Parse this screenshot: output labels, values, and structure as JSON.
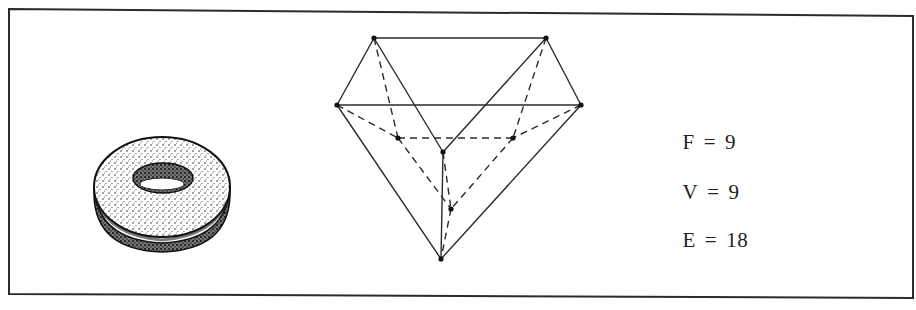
{
  "figure": {
    "border_color": "#2b2b2b",
    "stroke_color": "#2b2b2b",
    "background": "#ffffff"
  },
  "left_object": {
    "name": "doughnut (torus)",
    "center": [
      162,
      189
    ],
    "rx": 68,
    "ry": 48
  },
  "polyhedron": {
    "vertices": {
      "A": [
        374,
        38
      ],
      "B": [
        546,
        38
      ],
      "C": [
        337,
        105
      ],
      "D": [
        581,
        105
      ],
      "E": [
        398,
        138
      ],
      "G": [
        513,
        138
      ],
      "H": [
        443,
        152
      ],
      "I": [
        451,
        209
      ],
      "J": [
        441,
        259
      ]
    },
    "solid_edges": [
      [
        "A",
        "B"
      ],
      [
        "A",
        "C"
      ],
      [
        "B",
        "D"
      ],
      [
        "C",
        "D"
      ],
      [
        "A",
        "H"
      ],
      [
        "B",
        "H"
      ],
      [
        "C",
        "J"
      ],
      [
        "D",
        "J"
      ],
      [
        "H",
        "J"
      ]
    ],
    "dashed_edges": [
      [
        "A",
        "E"
      ],
      [
        "B",
        "G"
      ],
      [
        "C",
        "E"
      ],
      [
        "D",
        "G"
      ],
      [
        "E",
        "G"
      ],
      [
        "E",
        "I"
      ],
      [
        "G",
        "I"
      ],
      [
        "H",
        "I"
      ],
      [
        "I",
        "J"
      ]
    ]
  },
  "equations": [
    {
      "symbol": "F",
      "op": "=",
      "value": "9"
    },
    {
      "symbol": "V",
      "op": "=",
      "value": "9"
    },
    {
      "symbol": "E",
      "op": "=",
      "value": "18"
    }
  ]
}
